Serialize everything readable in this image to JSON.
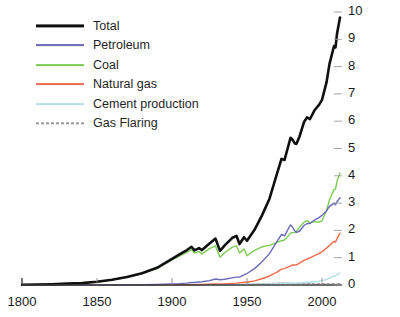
{
  "chart_data": {
    "type": "line",
    "title": "",
    "subtitle": "",
    "xlabel": "",
    "ylabel": "Metric tons of Carbon/year (Billions)",
    "xlim": [
      1800,
      2012
    ],
    "ylim": [
      0,
      10
    ],
    "grid": false,
    "legend_position": "top-left",
    "xticks": [
      "1800",
      "1850",
      "1900",
      "1950",
      "2000"
    ],
    "xtick_values": [
      1800,
      1850,
      1900,
      1950,
      2000
    ],
    "yticks": [
      "0",
      "1",
      "2",
      "3",
      "4",
      "5",
      "6",
      "7",
      "8",
      "9",
      "10"
    ],
    "ytick_values": [
      0,
      1,
      2,
      3,
      4,
      5,
      6,
      7,
      8,
      9,
      10
    ],
    "x": [
      1800,
      1810,
      1820,
      1830,
      1840,
      1850,
      1860,
      1870,
      1880,
      1890,
      1900,
      1905,
      1910,
      1913,
      1915,
      1918,
      1920,
      1925,
      1929,
      1932,
      1935,
      1940,
      1943,
      1945,
      1948,
      1950,
      1955,
      1960,
      1965,
      1970,
      1973,
      1975,
      1979,
      1980,
      1982,
      1983,
      1985,
      1988,
      1990,
      1992,
      1995,
      1998,
      2000,
      2003,
      2005,
      2008,
      2009,
      2010,
      2012
    ],
    "series": [
      {
        "name": "Total",
        "color": "#101010",
        "width": 2.6,
        "style": "solid",
        "values": [
          0.01,
          0.02,
          0.03,
          0.05,
          0.07,
          0.12,
          0.19,
          0.29,
          0.43,
          0.63,
          0.96,
          1.12,
          1.28,
          1.4,
          1.27,
          1.35,
          1.28,
          1.52,
          1.7,
          1.25,
          1.44,
          1.72,
          1.8,
          1.5,
          1.75,
          1.62,
          2.02,
          2.55,
          3.16,
          4.08,
          4.62,
          4.58,
          5.39,
          5.35,
          5.18,
          5.17,
          5.44,
          5.97,
          6.14,
          6.08,
          6.4,
          6.6,
          6.78,
          7.42,
          8.1,
          8.75,
          8.7,
          9.2,
          9.8
        ],
        "endpoint_value": 9.8
      },
      {
        "name": "Petroleum",
        "color": "#6a6ab8",
        "width": 1.4,
        "style": "solid",
        "values": [
          0.0,
          0.0,
          0.0,
          0.0,
          0.0,
          0.0,
          0.0,
          0.01,
          0.01,
          0.02,
          0.04,
          0.05,
          0.07,
          0.09,
          0.09,
          0.11,
          0.12,
          0.16,
          0.22,
          0.19,
          0.21,
          0.26,
          0.29,
          0.29,
          0.37,
          0.42,
          0.6,
          0.85,
          1.15,
          1.6,
          1.85,
          1.8,
          2.2,
          2.15,
          1.97,
          1.93,
          1.97,
          2.18,
          2.25,
          2.25,
          2.38,
          2.47,
          2.55,
          2.72,
          2.88,
          3.0,
          2.94,
          3.05,
          3.2
        ],
        "endpoint_value": 3.2
      },
      {
        "name": "Coal",
        "color": "#7ccc52",
        "width": 1.4,
        "style": "solid",
        "values": [
          0.01,
          0.02,
          0.03,
          0.05,
          0.07,
          0.12,
          0.19,
          0.28,
          0.42,
          0.61,
          0.92,
          1.06,
          1.2,
          1.3,
          1.17,
          1.22,
          1.14,
          1.33,
          1.43,
          1.02,
          1.18,
          1.38,
          1.44,
          1.17,
          1.32,
          1.07,
          1.27,
          1.4,
          1.45,
          1.56,
          1.62,
          1.65,
          1.89,
          1.92,
          1.92,
          1.97,
          2.12,
          2.3,
          2.36,
          2.28,
          2.32,
          2.3,
          2.35,
          2.72,
          3.12,
          3.5,
          3.51,
          3.8,
          4.1
        ],
        "endpoint_value": 4.1
      },
      {
        "name": "Natural gas",
        "color": "#ee6b4a",
        "width": 1.4,
        "style": "solid",
        "values": [
          0.0,
          0.0,
          0.0,
          0.0,
          0.0,
          0.0,
          0.0,
          0.0,
          0.0,
          0.0,
          0.0,
          0.01,
          0.01,
          0.01,
          0.01,
          0.02,
          0.02,
          0.03,
          0.04,
          0.03,
          0.04,
          0.06,
          0.07,
          0.08,
          0.1,
          0.1,
          0.15,
          0.23,
          0.33,
          0.47,
          0.58,
          0.6,
          0.7,
          0.73,
          0.73,
          0.74,
          0.8,
          0.9,
          0.95,
          0.99,
          1.08,
          1.15,
          1.22,
          1.35,
          1.45,
          1.6,
          1.57,
          1.7,
          1.9
        ],
        "endpoint_value": 1.9
      },
      {
        "name": "Cement production",
        "color": "#b3dfe8",
        "width": 1.4,
        "style": "solid",
        "values": [
          0.0,
          0.0,
          0.0,
          0.0,
          0.0,
          0.0,
          0.0,
          0.0,
          0.0,
          0.0,
          0.0,
          0.0,
          0.0,
          0.0,
          0.0,
          0.0,
          0.0,
          0.01,
          0.01,
          0.01,
          0.01,
          0.01,
          0.01,
          0.01,
          0.01,
          0.02,
          0.02,
          0.03,
          0.04,
          0.05,
          0.06,
          0.06,
          0.07,
          0.07,
          0.07,
          0.07,
          0.08,
          0.09,
          0.1,
          0.1,
          0.12,
          0.14,
          0.16,
          0.2,
          0.25,
          0.33,
          0.34,
          0.38,
          0.44
        ],
        "endpoint_value": 0.44
      },
      {
        "name": "Gas Flaring",
        "color": "#9a9a9a",
        "width": 1.0,
        "style": "dashed",
        "values": [
          0.0,
          0.0,
          0.0,
          0.0,
          0.0,
          0.0,
          0.0,
          0.0,
          0.0,
          0.0,
          0.0,
          0.0,
          0.0,
          0.0,
          0.0,
          0.0,
          0.01,
          0.01,
          0.01,
          0.01,
          0.01,
          0.02,
          0.02,
          0.02,
          0.03,
          0.03,
          0.04,
          0.05,
          0.06,
          0.07,
          0.08,
          0.08,
          0.07,
          0.07,
          0.06,
          0.06,
          0.05,
          0.05,
          0.05,
          0.05,
          0.05,
          0.05,
          0.05,
          0.05,
          0.05,
          0.05,
          0.05,
          0.05,
          0.05
        ],
        "endpoint_value": 0.05
      }
    ]
  },
  "legend": {
    "items": [
      {
        "label": "Total",
        "color": "#101010",
        "style": "solid",
        "width": 3.2
      },
      {
        "label": "Petroleum",
        "color": "#6a6ab8",
        "style": "solid",
        "width": 1.8
      },
      {
        "label": "Coal",
        "color": "#7ccc52",
        "style": "solid",
        "width": 1.8
      },
      {
        "label": "Natural gas",
        "color": "#ee6b4a",
        "style": "solid",
        "width": 1.8
      },
      {
        "label": "Cement production",
        "color": "#b3dfe8",
        "style": "solid",
        "width": 1.8
      },
      {
        "label": "Gas Flaring",
        "color": "#9a9a9a",
        "style": "dashed",
        "width": 1.4
      }
    ]
  },
  "axes": {
    "y_axis_label": "Metric tons of Carbon/year (Billions)",
    "y_tick_labels": [
      "10",
      "9",
      "8",
      "7",
      "6",
      "5",
      "4",
      "3",
      "2",
      "1",
      "0"
    ],
    "x_tick_labels": [
      "1800",
      "1850",
      "1900",
      "1950",
      "2000"
    ]
  }
}
